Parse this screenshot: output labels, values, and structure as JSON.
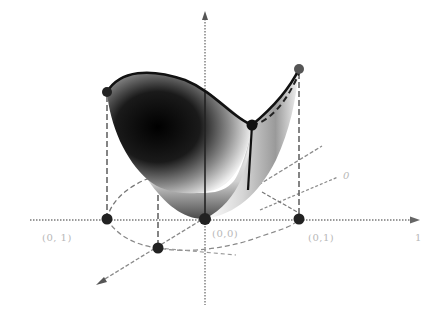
{
  "figure": {
    "colors": {
      "background": "#ffffff",
      "axis": "#8a8a8a",
      "surface_dark": "#0a0a0a",
      "surface_light": "#f2f2f2",
      "boundary_curve": "#111111",
      "points": "#222222",
      "label_text": "#b8b8b8"
    },
    "axes": {
      "z_axis_label": "",
      "x_axis_end_label": "1",
      "diagonal_axis_label": "0"
    },
    "labels": {
      "left_point": "(0, 1)",
      "origin": "(0,0)",
      "right_point": "(0,1)",
      "x_end": "1",
      "diagonal": "0"
    },
    "points": [
      {
        "name": "top-left",
        "x": 107,
        "y": 92
      },
      {
        "name": "top-right",
        "x": 299,
        "y": 69
      },
      {
        "name": "mid-right",
        "x": 252,
        "y": 125
      },
      {
        "name": "bottom-center",
        "x": 205,
        "y": 219
      },
      {
        "name": "base-left",
        "x": 107,
        "y": 219
      },
      {
        "name": "base-right",
        "x": 299,
        "y": 219
      },
      {
        "name": "base-front",
        "x": 158,
        "y": 248
      }
    ]
  }
}
